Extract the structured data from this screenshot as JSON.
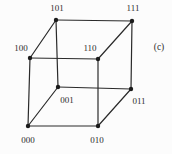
{
  "figure": {
    "caption_label": "(c)",
    "caption_pos": {
      "x": 159,
      "y": 50
    },
    "colors": {
      "background": "#fcfcfc",
      "edge": "#2a2a2a",
      "node": "#1b1b1b",
      "label": "#2e2e2e"
    },
    "graph": {
      "type": "3-cube-hypercube-graph",
      "node_radius": 2.2,
      "edge_width": 1.2,
      "nodes": [
        {
          "id": "000",
          "label": "000",
          "x": 28,
          "y": 126,
          "lx": 28,
          "ly": 143
        },
        {
          "id": "001",
          "label": "001",
          "x": 58,
          "y": 87,
          "lx": 67,
          "ly": 103
        },
        {
          "id": "010",
          "label": "010",
          "x": 98,
          "y": 126,
          "lx": 97,
          "ly": 143
        },
        {
          "id": "011",
          "label": "011",
          "x": 131,
          "y": 89,
          "lx": 139,
          "ly": 104
        },
        {
          "id": "100",
          "label": "100",
          "x": 30,
          "y": 58,
          "lx": 21,
          "ly": 51
        },
        {
          "id": "101",
          "label": "101",
          "x": 56,
          "y": 20,
          "lx": 57,
          "ly": 11
        },
        {
          "id": "110",
          "label": "110",
          "x": 98,
          "y": 59,
          "lx": 90,
          "ly": 51
        },
        {
          "id": "111",
          "label": "111",
          "x": 132,
          "y": 21,
          "lx": 133,
          "ly": 11
        }
      ],
      "edges": [
        [
          "000",
          "001"
        ],
        [
          "000",
          "010"
        ],
        [
          "000",
          "100"
        ],
        [
          "001",
          "011"
        ],
        [
          "001",
          "101"
        ],
        [
          "010",
          "011"
        ],
        [
          "010",
          "110"
        ],
        [
          "011",
          "111"
        ],
        [
          "100",
          "101"
        ],
        [
          "100",
          "110"
        ],
        [
          "101",
          "111"
        ],
        [
          "110",
          "111"
        ]
      ]
    }
  }
}
